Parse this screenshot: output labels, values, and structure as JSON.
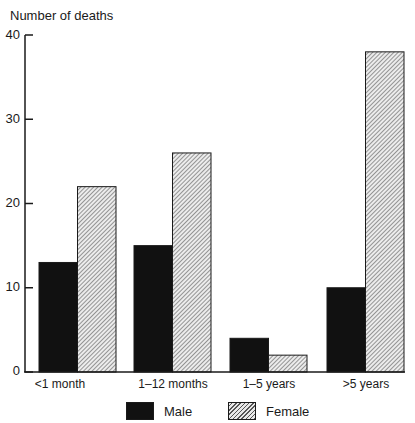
{
  "chart_data": {
    "type": "bar",
    "title": "",
    "xlabel": "",
    "ylabel": "Number of deaths",
    "ylim": [
      0,
      40
    ],
    "yticks": [
      0,
      10,
      20,
      30,
      40
    ],
    "grid": false,
    "legend_position": "bottom",
    "categories": [
      "<1 month",
      "1–12 months",
      "1–5 years",
      ">5 years"
    ],
    "series": [
      {
        "name": "Male",
        "values": [
          13,
          15,
          4,
          10
        ],
        "fill": "solid-black",
        "color": "#111111"
      },
      {
        "name": "Female",
        "values": [
          22,
          26,
          2,
          38
        ],
        "fill": "diagonal-hatch",
        "color": "#555555"
      }
    ]
  },
  "axis": {
    "ylabel": "Number of deaths",
    "ticks": [
      "0",
      "10",
      "20",
      "30",
      "40"
    ]
  },
  "categories": [
    "<1 month",
    "1–12 months",
    "1–5 years",
    ">5 years"
  ],
  "legend": {
    "male": "Male",
    "female": "Female"
  }
}
